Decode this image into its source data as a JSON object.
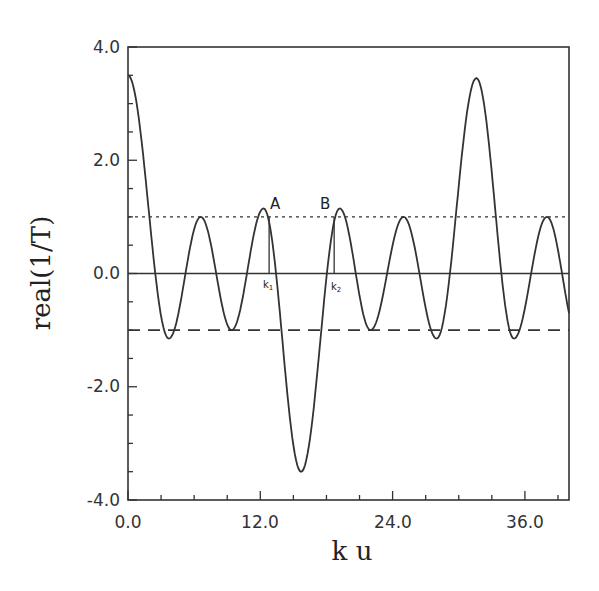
{
  "chart_data": {
    "type": "line",
    "title": "",
    "xlabel": "k u",
    "ylabel": "real(1/T)",
    "xlim": [
      0,
      40
    ],
    "ylim": [
      -4.0,
      4.0
    ],
    "x_ticks": [
      "0.0",
      "12.0",
      "24.0",
      "36.0"
    ],
    "y_ticks": [
      "4.0",
      "2.0",
      "0.0",
      "-2.0",
      "-4.0"
    ],
    "grid": false,
    "series": [
      {
        "name": "real(1/T)",
        "style": "solid",
        "x": [
          0,
          3.7,
          6.6,
          9.4,
          12.3,
          15.7,
          19.2,
          22.0,
          25.0,
          28.0,
          31.6,
          35.0,
          38.0,
          40.0
        ],
        "values": [
          3.5,
          -1.15,
          1.0,
          -1.0,
          1.15,
          -3.5,
          1.15,
          -1.0,
          1.0,
          -1.15,
          3.45,
          -1.15,
          1.0,
          -0.7
        ]
      },
      {
        "name": "upper bound",
        "style": "dotted",
        "x": [
          0,
          40
        ],
        "values": [
          1.0,
          1.0
        ]
      },
      {
        "name": "lower bound",
        "style": "dashed",
        "x": [
          0,
          40
        ],
        "values": [
          -1.0,
          -1.0
        ]
      },
      {
        "name": "zero line",
        "style": "solid",
        "x": [
          0,
          40
        ],
        "values": [
          0,
          0
        ]
      }
    ],
    "annotations": [
      {
        "text": "A",
        "x": 13.2,
        "y": 1.35
      },
      {
        "text": "B",
        "x": 17.2,
        "y": 1.35
      },
      {
        "text": "k1",
        "x": 12.6,
        "y": -0.25
      },
      {
        "text": "k2",
        "x": 18.6,
        "y": -0.25
      }
    ]
  }
}
